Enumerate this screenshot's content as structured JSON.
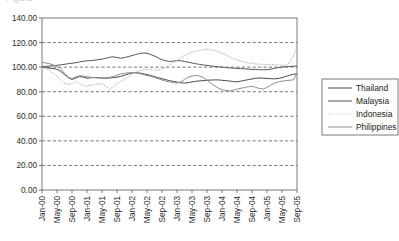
{
  "chart_data": {
    "type": "line",
    "title": "",
    "xlabel": "",
    "ylabel": "",
    "ylim": [
      0,
      140
    ],
    "ytick_step": 20,
    "ytick_labels": [
      "0.00",
      "20.00",
      "40.00",
      "60.00",
      "80.00",
      "100.00",
      "120.00",
      "140.00"
    ],
    "grid": true,
    "grid_style": "dashed-horizontal",
    "legend_position": "right",
    "x_tick_labels": [
      "Jan-00",
      "May-00",
      "Sep-00",
      "Jan-01",
      "May-01",
      "Sep-01",
      "Jan-02",
      "May-02",
      "Sep-02",
      "Jan-03",
      "May-03",
      "Sep-03",
      "Jan-04",
      "May-04",
      "Sep-04",
      "Jan-05",
      "May-05",
      "Sep-05"
    ],
    "x_tick_interval_months": 4,
    "x_start": "Jan-00",
    "x_end": "Sep-05",
    "x_points_count": 69,
    "x": [
      "Jan-00",
      "Feb-00",
      "Mar-00",
      "Apr-00",
      "May-00",
      "Jun-00",
      "Jul-00",
      "Aug-00",
      "Sep-00",
      "Oct-00",
      "Nov-00",
      "Dec-00",
      "Jan-01",
      "Feb-01",
      "Mar-01",
      "Apr-01",
      "May-01",
      "Jun-01",
      "Jul-01",
      "Aug-01",
      "Sep-01",
      "Oct-01",
      "Nov-01",
      "Dec-01",
      "Jan-02",
      "Feb-02",
      "Mar-02",
      "Apr-02",
      "May-02",
      "Jun-02",
      "Jul-02",
      "Aug-02",
      "Sep-02",
      "Oct-02",
      "Nov-02",
      "Dec-02",
      "Jan-03",
      "Feb-03",
      "Mar-03",
      "Apr-03",
      "May-03",
      "Jun-03",
      "Jul-03",
      "Aug-03",
      "Sep-03",
      "Oct-03",
      "Nov-03",
      "Dec-03",
      "Jan-04",
      "Feb-04",
      "Mar-04",
      "Apr-04",
      "May-04",
      "Jun-04",
      "Jul-04",
      "Aug-04",
      "Sep-04",
      "Oct-04",
      "Nov-04",
      "Dec-04",
      "Jan-05",
      "Feb-05",
      "Mar-05",
      "Apr-05",
      "May-05",
      "Jun-05",
      "Jul-05",
      "Aug-05",
      "Sep-05"
    ],
    "series": [
      {
        "name": "Thailand",
        "style": "solid",
        "color": "#4a4a4a",
        "width": 1.0,
        "values": [
          100.0,
          99.6,
          99.2,
          98.8,
          98.3,
          96.5,
          94.0,
          91.5,
          90.0,
          91.2,
          92.3,
          91.8,
          91.0,
          91.3,
          91.6,
          91.4,
          91.2,
          91.0,
          91.2,
          91.5,
          91.8,
          92.5,
          93.4,
          94.4,
          95.3,
          95.5,
          95.2,
          94.6,
          94.0,
          93.2,
          92.3,
          91.4,
          90.6,
          89.8,
          89.0,
          88.4,
          87.9,
          87.3,
          87.0,
          87.4,
          88.0,
          88.5,
          88.8,
          89.0,
          89.3,
          89.5,
          89.6,
          89.6,
          89.3,
          89.0,
          88.7,
          88.3,
          88.0,
          88.6,
          89.2,
          89.8,
          90.4,
          90.9,
          91.2,
          91.0,
          90.8,
          90.6,
          90.5,
          90.8,
          91.5,
          92.4,
          93.4,
          94.2,
          94.6
        ]
      },
      {
        "name": "Malaysia",
        "style": "solid",
        "color": "#555555",
        "width": 1.0,
        "values": [
          100.3,
          100.6,
          100.9,
          101.2,
          101.5,
          101.9,
          102.3,
          102.8,
          103.2,
          103.6,
          104.2,
          104.8,
          105.2,
          105.3,
          105.6,
          106.1,
          106.5,
          107.2,
          108.0,
          108.4,
          107.8,
          107.3,
          107.8,
          108.5,
          109.4,
          110.3,
          111.1,
          111.5,
          111.3,
          110.3,
          109.0,
          107.5,
          106.0,
          105.2,
          104.6,
          104.9,
          105.3,
          105.2,
          104.6,
          104.0,
          103.4,
          102.8,
          102.2,
          101.8,
          101.4,
          101.0,
          100.6,
          100.3,
          100.0,
          99.7,
          99.4,
          99.2,
          99.0,
          98.8,
          98.6,
          98.4,
          98.2,
          98.0,
          97.9,
          97.8,
          98.0,
          98.4,
          99.0,
          99.6,
          100.1,
          100.4,
          100.6,
          100.8,
          100.9
        ]
      },
      {
        "name": "Indonesia",
        "style": "dotted",
        "color": "#b4b4b4",
        "width": 1.0,
        "values": [
          100.0,
          99.0,
          97.6,
          95.2,
          92.5,
          89.5,
          87.2,
          86.0,
          86.6,
          88.0,
          86.5,
          85.0,
          84.5,
          85.2,
          86.0,
          86.5,
          86.2,
          84.5,
          82.2,
          84.0,
          86.5,
          88.5,
          90.0,
          92.0,
          94.5,
          96.0,
          97.2,
          97.8,
          98.4,
          98.0,
          97.5,
          97.8,
          98.4,
          99.5,
          101.5,
          103.5,
          105.5,
          107.5,
          109.5,
          111.0,
          112.2,
          113.0,
          113.6,
          114.0,
          114.5,
          114.0,
          113.5,
          112.5,
          111.3,
          110.0,
          108.6,
          107.2,
          106.0,
          105.0,
          104.2,
          103.5,
          103.0,
          102.6,
          102.4,
          102.3,
          102.2,
          102.1,
          102.0,
          101.8,
          101.6,
          101.5,
          103.5,
          109.0,
          115.0
        ]
      },
      {
        "name": "Philippines",
        "style": "solid",
        "color": "#8e8e8e",
        "width": 1.0,
        "values": [
          103.8,
          103.4,
          102.8,
          101.8,
          100.5,
          98.5,
          95.0,
          92.0,
          90.6,
          92.0,
          93.0,
          92.8,
          92.2,
          91.8,
          91.4,
          91.2,
          91.0,
          91.2,
          91.6,
          92.4,
          93.5,
          94.5,
          95.0,
          95.4,
          95.6,
          95.4,
          94.8,
          94.0,
          93.2,
          92.4,
          91.5,
          90.5,
          89.5,
          88.6,
          88.0,
          87.5,
          87.0,
          88.0,
          90.0,
          91.8,
          92.8,
          93.2,
          92.8,
          91.5,
          89.5,
          87.0,
          84.8,
          83.0,
          81.8,
          81.0,
          80.8,
          81.2,
          82.0,
          82.8,
          83.5,
          84.0,
          84.4,
          83.5,
          82.6,
          82.2,
          83.5,
          85.5,
          87.0,
          88.0,
          88.6,
          89.0,
          89.3,
          89.6,
          94.8
        ]
      }
    ]
  },
  "legend": {
    "entries": [
      {
        "label": "Thailand"
      },
      {
        "label": "Malaysia"
      },
      {
        "label": "Indonesia"
      },
      {
        "label": "Philippines"
      }
    ]
  },
  "colors": {
    "axis": "#6b6b6b",
    "grid": "#3d3d3d",
    "text": "#2b2b2b",
    "background": "#ffffff"
  },
  "clipped_header": "Figure"
}
